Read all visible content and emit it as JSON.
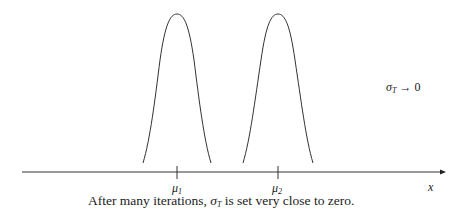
{
  "diagram": {
    "curves": [
      {
        "label": "mu1",
        "peak_x": 177
      },
      {
        "label": "mu2",
        "peak_x": 278
      }
    ],
    "tick_labels": {
      "mu1": {
        "sym": "μ",
        "sub": "1"
      },
      "mu2": {
        "sym": "μ",
        "sub": "2"
      }
    },
    "axis_label": "x",
    "annotation": {
      "sym": "σ",
      "sub": "T",
      "rest": " → 0"
    },
    "caption": {
      "before": "After many iterations, ",
      "sym": "σ",
      "sub": "T",
      "after": " is set very close to zero."
    }
  }
}
